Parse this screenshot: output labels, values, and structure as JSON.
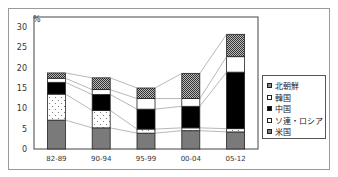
{
  "chart_data": {
    "type": "bar",
    "stacked": true,
    "title": "",
    "ylabel": "%",
    "xlabel": "",
    "ylim": [
      0,
      30
    ],
    "yticks": [
      0,
      5,
      10,
      15,
      20,
      25,
      30
    ],
    "categories": [
      "82-89",
      "90-94",
      "95-99",
      "00-04",
      "05-12"
    ],
    "series": [
      {
        "name": "米国",
        "pattern": "gray",
        "values": [
          7.1,
          5.2,
          3.9,
          4.5,
          4.2
        ]
      },
      {
        "name": "ソ連・ロシア",
        "pattern": "dotted",
        "values": [
          6.4,
          4.3,
          1.0,
          0.7,
          0.8
        ]
      },
      {
        "name": "中国",
        "pattern": "black",
        "values": [
          2.9,
          3.9,
          4.9,
          5.3,
          13.9
        ]
      },
      {
        "name": "韓国",
        "pattern": "white",
        "values": [
          1.0,
          1.2,
          2.6,
          1.9,
          3.8
        ]
      },
      {
        "name": "北朝鮮",
        "pattern": "hatched",
        "values": [
          1.3,
          2.9,
          2.6,
          6.2,
          5.5
        ]
      }
    ],
    "connector_lines": true,
    "grid": false,
    "legend_position": "right"
  },
  "legend": {
    "items": [
      {
        "label": "北朝鮮",
        "pattern": "hatched"
      },
      {
        "label": "韓国",
        "pattern": "white"
      },
      {
        "label": "中国",
        "pattern": "black"
      },
      {
        "label": "ソ連・ロシア",
        "pattern": "dotted"
      },
      {
        "label": "米国",
        "pattern": "gray"
      }
    ]
  },
  "axis": {
    "y_unit": "%"
  },
  "colors": {
    "gray": "#7a7a7a",
    "black": "#000000",
    "white": "#ffffff",
    "frame": "#9a9a9a"
  }
}
